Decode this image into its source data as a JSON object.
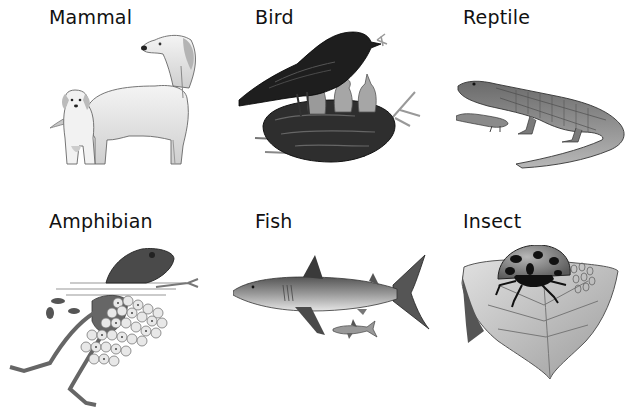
{
  "categories": [
    {
      "id": "mammal",
      "label": "Mammal",
      "illustration": "dog-and-puppy-icon"
    },
    {
      "id": "bird",
      "label": "Bird",
      "illustration": "bird-feeding-chicks-in-nest-icon"
    },
    {
      "id": "reptile",
      "label": "Reptile",
      "illustration": "alligator-with-baby-icon"
    },
    {
      "id": "amphibian",
      "label": "Amphibian",
      "illustration": "frog-with-frogspawn-icon"
    },
    {
      "id": "fish",
      "label": "Fish",
      "illustration": "shark-with-small-shark-icon"
    },
    {
      "id": "insect",
      "label": "Insect",
      "illustration": "ladybird-on-leaf-icon"
    }
  ],
  "colors": {
    "background": "#ffffff",
    "text": "#111111",
    "ink": "#2a2a2a"
  }
}
